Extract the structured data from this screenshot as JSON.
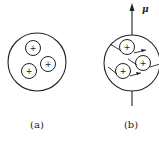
{
  "figure": {
    "panels": [
      {
        "label": "(a)",
        "description": "nucleus with unaligned proton spins",
        "particles": [
          {
            "symbol": "+"
          },
          {
            "symbol": "+"
          },
          {
            "symbol": "+"
          }
        ]
      },
      {
        "label": "(b)",
        "description": "nucleus with aligned spins and magnetic moment",
        "moment_label": "μ",
        "particles": [
          {
            "symbol": "+"
          },
          {
            "symbol": "+"
          },
          {
            "symbol": "+"
          }
        ]
      }
    ],
    "colors": {
      "stroke": "#222222",
      "background": "#ffffff"
    }
  }
}
